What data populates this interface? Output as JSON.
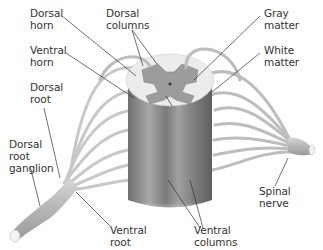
{
  "diagram": {
    "labels": [
      {
        "id": "dorsal-horn",
        "text": "Dorsal\nhorn",
        "x": 30,
        "y": 10
      },
      {
        "id": "dorsal-columns",
        "text": "Dorsal\ncolumns",
        "x": 106,
        "y": 10
      },
      {
        "id": "gray-matter",
        "text": "Gray\nmatter",
        "x": 264,
        "y": 10
      },
      {
        "id": "ventral-horn",
        "text": "Ventral\nhorn",
        "x": 30,
        "y": 47
      },
      {
        "id": "white-matter",
        "text": "White\nmatter",
        "x": 264,
        "y": 47
      },
      {
        "id": "dorsal-root",
        "text": "Dorsal\nroot",
        "x": 30,
        "y": 84
      },
      {
        "id": "dorsal-root-ganglion",
        "text": "Dorsal\nroot\nganglion",
        "x": 9,
        "y": 140
      },
      {
        "id": "spinal-nerve",
        "text": "Spinal\nnerve",
        "x": 259,
        "y": 184
      },
      {
        "id": "ventral-root",
        "text": "Ventral\nroot",
        "x": 110,
        "y": 224
      },
      {
        "id": "ventral-columns",
        "text": "Ventral\ncolumns",
        "x": 194,
        "y": 224
      }
    ],
    "colors": {
      "white_matter": "#e8e8e8",
      "gray_matter": "#9a9a9a",
      "cord_side": "#8c8c8c",
      "nerve": "#c4c4c4",
      "leader_line": "#333333",
      "text": "#333333"
    }
  }
}
